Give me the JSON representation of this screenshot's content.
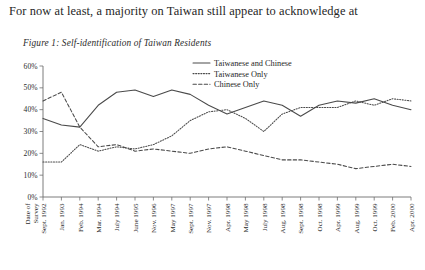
{
  "page": {
    "body_text": "For now at least, a majority on Taiwan still appear to acknowledge at",
    "figure_caption": "Figure 1: Self-identification of Taiwan Residents"
  },
  "chart_data": {
    "type": "line",
    "title": "Figure 1: Self-identification of Taiwan Residents",
    "xlabel": "Date of Survey",
    "ylabel": "",
    "ylim": [
      0,
      60
    ],
    "yticks": [
      0,
      10,
      20,
      30,
      40,
      50,
      60
    ],
    "ytick_labels": [
      "0%",
      "10%",
      "20%",
      "30%",
      "40%",
      "50%",
      "60%"
    ],
    "grid": false,
    "legend_position": "top-center",
    "categories": [
      "Sept. 1992",
      "Jan. 1993",
      "Feb. 1994",
      "Mar. 1994",
      "July 1994",
      "June 1995",
      "Nov. 1996",
      "May 1997",
      "Sept. 1997",
      "Nov. 1997",
      "Apr. 1998",
      "May 1998",
      "July 1998",
      "Aug. 1998",
      "Sept. 1998",
      "Oct. 1998",
      "Apr. 1999",
      "Aug. 1999",
      "Oct. 1999",
      "Feb. 2000",
      "Apr. 2000"
    ],
    "series": [
      {
        "name": "Taiwanese and Chinese",
        "style": "solid",
        "values": [
          36,
          33,
          32,
          42,
          48,
          49,
          46,
          49,
          47,
          42,
          38,
          41,
          44,
          42,
          37,
          42,
          44,
          43,
          45,
          42,
          40
        ]
      },
      {
        "name": "Taiwanese Only",
        "style": "dotted",
        "values": [
          16,
          16,
          24,
          21,
          23,
          22,
          24,
          28,
          35,
          39,
          40,
          36,
          30,
          38,
          41,
          41,
          41,
          44,
          42,
          45,
          44
        ]
      },
      {
        "name": "Chinese Only",
        "style": "dashed",
        "values": [
          44,
          48,
          32,
          23,
          24,
          21,
          22,
          21,
          20,
          22,
          23,
          21,
          19,
          17,
          17,
          16,
          15,
          13,
          14,
          15,
          14
        ]
      }
    ]
  },
  "legend": [
    {
      "label": "Taiwanese and Chinese",
      "style": "solid"
    },
    {
      "label": "Taiwanese Only",
      "style": "dotted"
    },
    {
      "label": "Chinese Only",
      "style": "dashed"
    }
  ],
  "axis": {
    "x_title_line1": "Date of",
    "x_title_line2": "Survey"
  }
}
